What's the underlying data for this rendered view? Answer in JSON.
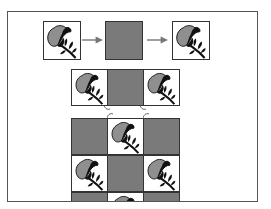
{
  "figure": {
    "colors": {
      "frame": "#555555",
      "tile_border": "#333333",
      "gray_fill": "#7a7a7a",
      "petal_fill": "#8f8f8f",
      "ink": "#111111",
      "arrow": "#777777"
    },
    "top_row": [
      "flower",
      "gray",
      "flower"
    ],
    "middle_row": [
      "flower",
      "gray",
      "flower"
    ],
    "grid": [
      [
        "gray",
        "flower",
        "gray"
      ],
      [
        "flower",
        "gray",
        "flower"
      ],
      [
        "gray",
        "flower",
        "gray"
      ]
    ],
    "icons": {
      "tile_image": "flower-icon",
      "step": "arrow-right-icon"
    }
  }
}
